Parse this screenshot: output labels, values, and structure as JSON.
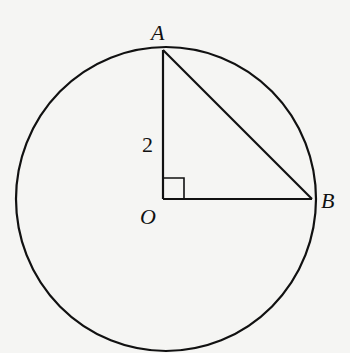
{
  "diagram": {
    "type": "geometry",
    "points": {
      "A": {
        "label": "A",
        "x": 163,
        "y": 50
      },
      "O": {
        "label": "O",
        "x": 163,
        "y": 199
      },
      "B": {
        "label": "B",
        "x": 312,
        "y": 199
      }
    },
    "segments": [
      {
        "from": "A",
        "to": "O",
        "label": "2"
      },
      {
        "from": "O",
        "to": "B",
        "label": ""
      },
      {
        "from": "A",
        "to": "B",
        "label": ""
      }
    ],
    "right_angle_at": "O",
    "circle": {
      "cx": 166,
      "cy": 199,
      "rx": 150,
      "ry": 152
    },
    "labels": {
      "A": "A",
      "B": "B",
      "O": "O",
      "side_AO": "2"
    },
    "colors": {
      "stroke": "#111111",
      "background": "#f5f5f3"
    }
  }
}
